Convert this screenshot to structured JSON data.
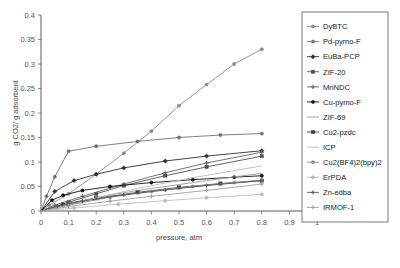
{
  "chart_data": {
    "type": "line",
    "title": "",
    "xlabel": "pressure, atm",
    "ylabel": "g CO2/ g adsorbent",
    "xlim": [
      0,
      1
    ],
    "ylim": [
      0,
      0.4
    ],
    "xticks": [
      "0",
      "0.1",
      "0.2",
      "0.3",
      "0.4",
      "0.5",
      "0.6",
      "0.7",
      "0.8",
      "0.9",
      "1"
    ],
    "yticks": [
      "0",
      "0.05",
      "0.1",
      "0.15",
      "0.2",
      "0.25",
      "0.3",
      "0.35",
      "0.4"
    ],
    "grid": false,
    "legend_position": "right-outside",
    "series": [
      {
        "name": "DyBTC",
        "color": "#8a8a8a",
        "marker": "circle",
        "x": [
          0,
          0.03,
          0.1,
          0.2,
          0.3,
          0.4,
          0.5,
          0.6,
          0.7,
          0.8
        ],
        "y": [
          0,
          0.012,
          0.035,
          0.075,
          0.118,
          0.163,
          0.215,
          0.258,
          0.3,
          0.33
        ]
      },
      {
        "name": "Pd-pymo-F",
        "color": "#707070",
        "marker": "circle",
        "x": [
          0,
          0.02,
          0.05,
          0.1,
          0.2,
          0.35,
          0.5,
          0.65,
          0.8
        ],
        "y": [
          0,
          0.03,
          0.07,
          0.122,
          0.132,
          0.142,
          0.15,
          0.155,
          0.158
        ]
      },
      {
        "name": "EuBa-PCP",
        "color": "#2f2f2f",
        "marker": "diamond",
        "x": [
          0,
          0.05,
          0.12,
          0.2,
          0.3,
          0.45,
          0.6,
          0.8
        ],
        "y": [
          0,
          0.04,
          0.062,
          0.075,
          0.088,
          0.102,
          0.112,
          0.123
        ]
      },
      {
        "name": "ZIF-20",
        "color": "#4f4f4f",
        "marker": "square",
        "x": [
          0,
          0.1,
          0.2,
          0.3,
          0.45,
          0.6,
          0.8
        ],
        "y": [
          0,
          0.018,
          0.035,
          0.052,
          0.072,
          0.09,
          0.112
        ]
      },
      {
        "name": "MnNDC",
        "color": "#636363",
        "marker": "cross",
        "x": [
          0,
          0.05,
          0.15,
          0.3,
          0.45,
          0.6,
          0.8
        ],
        "y": [
          0,
          0.012,
          0.03,
          0.055,
          0.078,
          0.098,
          0.12
        ]
      },
      {
        "name": "Cu-pymo-F",
        "color": "#111111",
        "marker": "circle",
        "x": [
          0,
          0.04,
          0.08,
          0.15,
          0.25,
          0.4,
          0.55,
          0.7,
          0.8
        ],
        "y": [
          0,
          0.022,
          0.032,
          0.042,
          0.05,
          0.058,
          0.064,
          0.069,
          0.072
        ]
      },
      {
        "name": "ZIF-69",
        "color": "#9a9a9a",
        "marker": "none",
        "x": [
          0,
          0.1,
          0.25,
          0.4,
          0.6,
          0.8
        ],
        "y": [
          0,
          0.016,
          0.033,
          0.046,
          0.062,
          0.077
        ]
      },
      {
        "name": "Cu2-pzdc",
        "color": "#3d3d3d",
        "marker": "square",
        "x": [
          0,
          0.08,
          0.2,
          0.35,
          0.5,
          0.65,
          0.8
        ],
        "y": [
          0,
          0.013,
          0.026,
          0.038,
          0.048,
          0.056,
          0.062
        ]
      },
      {
        "name": "ICP",
        "color": "#b9b9b9",
        "marker": "none",
        "x": [
          0,
          0.15,
          0.35,
          0.55,
          0.8
        ],
        "y": [
          0,
          0.02,
          0.046,
          0.068,
          0.092
        ]
      },
      {
        "name": "Cu2(BF4)2(bpy)2",
        "color": "#8d8d8d",
        "marker": "circle",
        "x": [
          0,
          0.1,
          0.25,
          0.4,
          0.55,
          0.7,
          0.8
        ],
        "y": [
          0,
          0.012,
          0.028,
          0.04,
          0.05,
          0.058,
          0.063
        ]
      },
      {
        "name": "ErPDA",
        "color": "#bcbcbc",
        "marker": "circle",
        "x": [
          0,
          0.12,
          0.28,
          0.45,
          0.6,
          0.8
        ],
        "y": [
          0,
          0.006,
          0.014,
          0.021,
          0.027,
          0.034
        ]
      },
      {
        "name": "Zn-edba",
        "color": "#5a5a5a",
        "marker": "cross",
        "x": [
          0,
          0.06,
          0.15,
          0.3,
          0.45,
          0.6,
          0.8
        ],
        "y": [
          0,
          0.01,
          0.02,
          0.033,
          0.043,
          0.052,
          0.062
        ]
      },
      {
        "name": "IRMOF-1",
        "color": "#9e9e9e",
        "marker": "cross",
        "x": [
          0,
          0.1,
          0.25,
          0.4,
          0.6,
          0.8
        ],
        "y": [
          0,
          0.009,
          0.02,
          0.03,
          0.042,
          0.055
        ]
      }
    ]
  }
}
